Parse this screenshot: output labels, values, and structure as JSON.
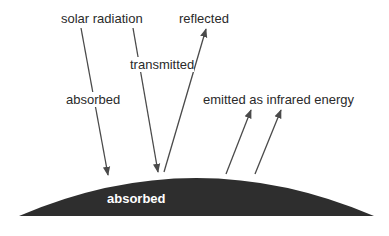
{
  "diagram": {
    "labels": {
      "solar_radiation": "solar radiation",
      "reflected": "reflected",
      "transmitted": "transmitted",
      "absorbed_atmosphere": "absorbed",
      "emitted": "emitted as infrared energy",
      "absorbed_ground": "absorbed"
    },
    "colors": {
      "ground": "#2e2e2e",
      "arrow": "#4a4a4a",
      "text": "#2a2a2a",
      "ground_text": "#ffffff"
    }
  }
}
